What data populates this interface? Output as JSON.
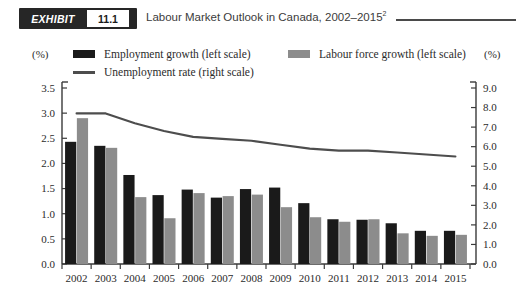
{
  "header": {
    "badge_word": "EXHIBIT",
    "badge_number": "11.1",
    "title_text": "Labour Market Outlook in Canada, 2002–2015",
    "title_superscript": "2"
  },
  "legend": {
    "employment_label": "Employment growth (left scale)",
    "labourforce_label": "Labour force growth (left scale)",
    "unemployment_label": "Unemployment rate (right scale)",
    "employment_color": "#1a1a1a",
    "labourforce_color": "#8c8c8c",
    "unemployment_color": "#4d4d4d"
  },
  "axes": {
    "left_unit": "(%)",
    "right_unit": "(%)"
  },
  "chart_data": {
    "type": "bar",
    "title": "Labour Market Outlook in Canada, 2002–2015",
    "xlabel": "",
    "ylabel": "(%)",
    "y2label": "(%)",
    "ylim": [
      0.0,
      3.5
    ],
    "y2lim": [
      0.0,
      9.0
    ],
    "grid": false,
    "legend_position": "top",
    "categories": [
      "2002",
      "2003",
      "2004",
      "2005",
      "2006",
      "2007",
      "2008",
      "2009",
      "2010",
      "2011",
      "2012",
      "2013",
      "2014",
      "2015"
    ],
    "left_ticks": [
      "0.0",
      "0.5",
      "1.0",
      "1.5",
      "2.0",
      "2.5",
      "3.0",
      "3.5"
    ],
    "right_ticks": [
      "0.0",
      "1.0",
      "2.0",
      "3.0",
      "4.0",
      "5.0",
      "6.0",
      "7.0",
      "8.0",
      "9.0"
    ],
    "series": [
      {
        "name": "Employment growth (left scale)",
        "kind": "bar",
        "axis": "left",
        "color": "#1a1a1a",
        "values": [
          2.43,
          2.35,
          1.77,
          1.37,
          1.48,
          1.32,
          1.49,
          1.52,
          1.21,
          0.89,
          0.88,
          0.81,
          0.66,
          0.66
        ]
      },
      {
        "name": "Labour force growth (left scale)",
        "kind": "bar",
        "axis": "left",
        "color": "#8c8c8c",
        "values": [
          2.9,
          2.31,
          1.33,
          0.91,
          1.41,
          1.35,
          1.38,
          1.13,
          0.93,
          0.84,
          0.89,
          0.61,
          0.56,
          0.58
        ]
      },
      {
        "name": "Unemployment rate (right scale)",
        "kind": "line",
        "axis": "right",
        "color": "#4d4d4d",
        "values": [
          7.7,
          7.7,
          7.2,
          6.8,
          6.5,
          6.4,
          6.3,
          6.1,
          5.9,
          5.8,
          5.8,
          5.7,
          5.6,
          5.5
        ]
      }
    ]
  }
}
